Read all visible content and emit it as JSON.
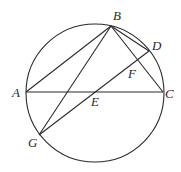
{
  "diagram": {
    "type": "geometry",
    "circle": {
      "cx": 95,
      "cy": 93,
      "r": 69
    },
    "points": {
      "A": {
        "x": 26,
        "y": 92
      },
      "B": {
        "x": 111,
        "y": 26
      },
      "C": {
        "x": 163,
        "y": 92
      },
      "D": {
        "x": 149,
        "y": 51
      },
      "E": {
        "x": 96,
        "y": 92
      },
      "F": {
        "x": 137,
        "y": 62
      },
      "G": {
        "x": 39,
        "y": 135
      }
    },
    "labels": [
      {
        "text": "B",
        "x": 113,
        "y": 20
      },
      {
        "text": "D",
        "x": 152,
        "y": 50
      },
      {
        "text": "F",
        "x": 128,
        "y": 78
      },
      {
        "text": "A",
        "x": 12,
        "y": 97
      },
      {
        "text": "C",
        "x": 165,
        "y": 98
      },
      {
        "text": "E",
        "x": 91,
        "y": 106
      },
      {
        "text": "G",
        "x": 28,
        "y": 147
      }
    ],
    "segments": [
      "AB",
      "BC",
      "BD",
      "AC",
      "BG",
      "GD"
    ]
  }
}
